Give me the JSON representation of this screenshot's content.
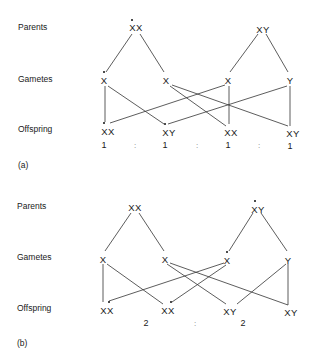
{
  "row_labels": {
    "parents": "Parents",
    "gametes": "Gametes",
    "offspring": "Offspring"
  },
  "panel_a": {
    "label": "(a)",
    "parents": [
      "XX",
      "XY"
    ],
    "gametes": [
      "X",
      "X",
      "X",
      "Y"
    ],
    "offspring": [
      "XX",
      "XY",
      "XX",
      "XY"
    ],
    "marked": "maternal X of mother (dotted), carried to gamete 1 and offspring 1 & 2",
    "ratio": [
      "1",
      ":",
      "1",
      ":",
      "1",
      ":",
      "1"
    ]
  },
  "panel_b": {
    "label": "(b)",
    "parents": [
      "XX",
      "XY"
    ],
    "gametes": [
      "X",
      "X",
      "X",
      "Y"
    ],
    "offspring": [
      "XX",
      "XX",
      "XY",
      "XY"
    ],
    "marked": "X of father (dotted), carried to gamete 3 and offspring 1 & 2",
    "ratio": [
      "2",
      ":",
      "2"
    ]
  }
}
